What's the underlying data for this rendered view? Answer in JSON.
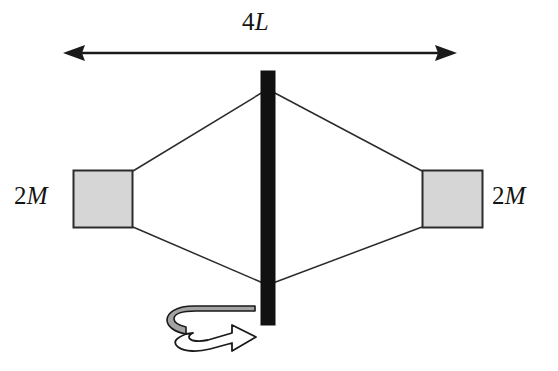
{
  "figure": {
    "background_color": "#ffffff"
  },
  "labels": {
    "span": {
      "prefix": "4",
      "symbol": "L",
      "full": "4L"
    },
    "mass_left": {
      "prefix": "2",
      "symbol": "M",
      "full": "2M"
    },
    "mass_right": {
      "prefix": "2",
      "symbol": "M",
      "full": "2M"
    }
  },
  "colors": {
    "axis_bar": "#111111",
    "mass_fill": "#d6d6d6",
    "mass_stroke": "#2b2b2b",
    "rod_stroke": "#2b2b2b",
    "dimension_stroke": "#1a1a1a",
    "ribbon_fill": "#a3a3a3",
    "ribbon_stroke": "#1a1a1a",
    "arrowhead_fill": "#ffffff",
    "text": "#141414"
  },
  "geometry": {
    "dimension_line": {
      "y": 53,
      "x_start": 65,
      "x_end": 456,
      "stroke_width": 2
    },
    "axis_bar": {
      "x": 261,
      "y": 71,
      "width": 14,
      "height": 254
    },
    "mass_left_square": {
      "x": 73,
      "y": 170,
      "width": 60,
      "height": 58
    },
    "mass_right_square": {
      "x": 422,
      "y": 170,
      "width": 61,
      "height": 58
    },
    "rod_upper_hub": {
      "x": 263,
      "y": 92
    },
    "rod_lower_hub": {
      "x": 263,
      "y": 283
    },
    "rotation_arrow": {
      "cx": 214,
      "cy": 327,
      "direction": "clockwise-viewed-from-above"
    }
  },
  "icons": {
    "dimension_arrow_left": "arrow-left-icon",
    "dimension_arrow_right": "arrow-right-icon",
    "rotation": "rotation-arrow-icon"
  }
}
